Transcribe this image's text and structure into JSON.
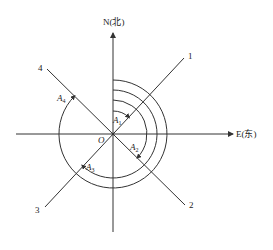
{
  "diagram": {
    "type": "azimuth-angle-diagram",
    "origin_label": "O",
    "axes": {
      "north_label": "N(北)",
      "east_label": "E(东)"
    },
    "directions": [
      {
        "id": "1",
        "label": "1",
        "azimuth_deg": 45
      },
      {
        "id": "2",
        "label": "2",
        "azimuth_deg": 135
      },
      {
        "id": "3",
        "label": "3",
        "azimuth_deg": 225
      },
      {
        "id": "4",
        "label": "4",
        "azimuth_deg": 315
      }
    ],
    "angles": [
      {
        "label": "A",
        "sub": "1",
        "from": "N",
        "to": "1"
      },
      {
        "label": "A",
        "sub": "2",
        "from": "N",
        "to": "2"
      },
      {
        "label": "A",
        "sub": "3",
        "from": "N",
        "to": "3"
      },
      {
        "label": "A",
        "sub": "4",
        "from": "N",
        "to": "4"
      }
    ],
    "colors": {
      "line": "#333333",
      "text": "#222222",
      "background": "#ffffff"
    }
  }
}
